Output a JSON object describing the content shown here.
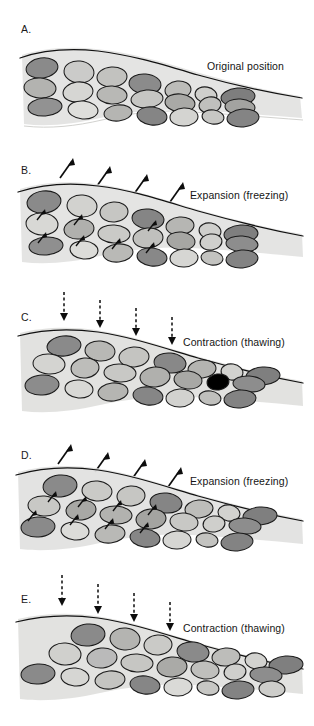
{
  "figure": {
    "background_color": "#ffffff",
    "width": 314,
    "height": 726
  },
  "palette": {
    "soil_matrix": "#e3e3e1",
    "soil_matrix_edge": "#d6d6d3",
    "clast_dark": "#7d7d7d",
    "clast_medium": "#a8a8a8",
    "clast_light": "#c9c9c7",
    "clast_pale": "#e0e0dd",
    "outline": "#1b1b1b",
    "text": "#151515",
    "arrow": "#0d0d0d"
  },
  "panels": [
    {
      "letter": "A.",
      "label": "Original position",
      "state": "original",
      "arrow_type": "none",
      "surface_arrow_count": 0,
      "internal_arrow_count": 0
    },
    {
      "letter": "B.",
      "label": "Expansion (freezing)",
      "state": "expansion",
      "arrow_type": "solid-diagonal-up",
      "surface_arrow_count": 4,
      "internal_arrow_count": 7
    },
    {
      "letter": "C.",
      "label": "Contraction (thawing)",
      "state": "contraction",
      "arrow_type": "dashed-vertical-down",
      "surface_arrow_count": 4,
      "internal_arrow_count": 0
    },
    {
      "letter": "D.",
      "label": "Expansion (freezing)",
      "state": "expansion",
      "arrow_type": "solid-diagonal-up",
      "surface_arrow_count": 4,
      "internal_arrow_count": 8
    },
    {
      "letter": "E.",
      "label": "Contraction (thawing)",
      "state": "contraction",
      "arrow_type": "dashed-vertical-down",
      "surface_arrow_count": 4,
      "internal_arrow_count": 0
    }
  ],
  "icons": {
    "solid_arrow": "arrow-up-right-solid-icon",
    "dashed_arrow": "arrow-down-dashed-icon"
  }
}
